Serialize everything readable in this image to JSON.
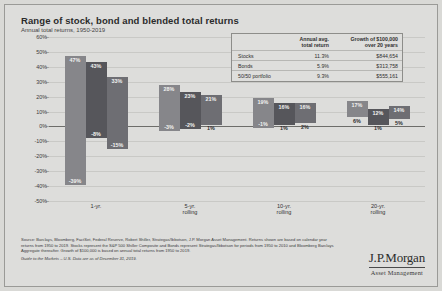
{
  "slide": {
    "title": "Range of stock, bond and blended total returns",
    "subtitle": "Annual total returns, 1950-2019",
    "page_marker": ""
  },
  "legend_table": {
    "col_blank": "",
    "col_avg": "Annual avg.\ntotal return",
    "col_avg_line1": "Annual avg.",
    "col_avg_line2": "total return",
    "col_growth_line1": "Growth of $100,000",
    "col_growth_line2": "over 20 years",
    "rows": [
      {
        "name": "Stocks",
        "avg": "11.3%",
        "growth": "$844,654"
      },
      {
        "name": "Bonds",
        "avg": "5.9%",
        "growth": "$313,758"
      },
      {
        "name": "50/50 portfolio",
        "avg": "9.3%",
        "growth": "$555,161"
      }
    ]
  },
  "notes": {
    "line1": "Source: Barclays, Bloomberg, FactSet, Federal Reserve, Robert Shiller, Strategas/Ibbotson, J.P. Morgan Asset Management.",
    "line2": "Returns shown are based on calendar year returns from 1950 to 2019. Stocks represent the S&P 500 Shiller Composite and Bonds represent Strategas/Ibbotson for periods from 1950 to 2010 and Bloomberg Barclays Aggregate thereafter. Growth of $100,000 is based on annual total returns from 1950 to 2019.",
    "guide": "Guide to the Markets – U.S. Data are as of December 31, 2019."
  },
  "logo": {
    "brand": "J.P.Morgan",
    "tagline": "Asset Management"
  },
  "chart_data": {
    "type": "bar",
    "title": "Range of stock, bond and blended total returns",
    "subtitle": "Annual total returns, 1950-2019",
    "xlabel": "",
    "ylabel": "",
    "ylim": [
      -50,
      60
    ],
    "ytick_step": 10,
    "ytick_labels": [
      "60%",
      "50%",
      "40%",
      "30%",
      "20%",
      "10%",
      "0%",
      "-10%",
      "-20%",
      "-30%",
      "-40%",
      "-50%"
    ],
    "ytick_values": [
      60,
      50,
      40,
      30,
      20,
      10,
      0,
      -10,
      -20,
      -30,
      -40,
      -50
    ],
    "grid": true,
    "legend_position": "top-right-table",
    "categories": [
      "1-yr.",
      "5-yr. rolling",
      "10-yr. rolling",
      "20-yr. rolling"
    ],
    "category_label_lines": [
      [
        "1-yr.",
        ""
      ],
      [
        "5-yr.",
        "rolling"
      ],
      [
        "10-yr.",
        "rolling"
      ],
      [
        "20-yr.",
        "rolling"
      ]
    ],
    "series": [
      {
        "name": "Stocks",
        "color": "#86868a",
        "max": [
          47,
          28,
          19,
          17
        ],
        "min": [
          -39,
          -3,
          -1,
          6
        ],
        "max_labels": [
          "47%",
          "28%",
          "19%",
          "17%"
        ],
        "min_labels": [
          "-39%",
          "-3%",
          "-1%",
          "6%"
        ]
      },
      {
        "name": "Bonds",
        "color": "#56565b",
        "max": [
          43,
          23,
          16,
          12
        ],
        "min": [
          -8,
          -2,
          1,
          1
        ],
        "max_labels": [
          "43%",
          "23%",
          "16%",
          "12%"
        ],
        "min_labels": [
          "-8%",
          "-2%",
          "1%",
          "1%"
        ]
      },
      {
        "name": "50/50 portfolio",
        "color": "#6e6e73",
        "max": [
          33,
          21,
          16,
          14
        ],
        "min": [
          -15,
          1,
          2,
          5
        ],
        "max_labels": [
          "33%",
          "21%",
          "16%",
          "14%"
        ],
        "min_labels": [
          "-15%",
          "1%",
          "2%",
          "5%"
        ]
      }
    ]
  }
}
